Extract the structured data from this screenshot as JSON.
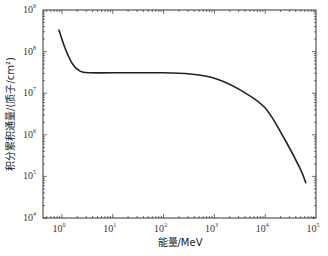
{
  "chart_data": {
    "type": "line",
    "title": "",
    "xlabel": "能量/MeV",
    "ylabel": "积分累积通量/(质子/cm²)",
    "xscale": "log",
    "yscale": "log",
    "xlim": [
      0.5,
      100000
    ],
    "ylim": [
      10000,
      1000000000
    ],
    "x_ticks": [
      1,
      10,
      100,
      1000,
      10000,
      100000
    ],
    "x_tick_labels": [
      "10^0",
      "10^1",
      "10^2",
      "10^3",
      "10^4",
      "10^5"
    ],
    "y_ticks": [
      10000,
      100000,
      1000000,
      10000000,
      100000000,
      1000000000
    ],
    "y_tick_labels": [
      "10^4",
      "10^5",
      "10^6",
      "10^7",
      "10^8",
      "10^9"
    ],
    "grid": false,
    "legend": null,
    "series": [
      {
        "name": "integral fluence",
        "color": "#222222",
        "x": [
          0.87,
          1.15,
          1.57,
          2.26,
          3.6,
          10,
          100,
          330,
          1000,
          3200,
          10000,
          24600,
          48000,
          63000
        ],
        "y": [
          330000000,
          120000000,
          53000000,
          34000000,
          31000000,
          31000000,
          31000000,
          29000000,
          23000000,
          12000000,
          4400000,
          750000,
          160000,
          71000
        ]
      }
    ]
  },
  "axes": {
    "x_title": "能量/MeV",
    "y_title": "积分累积通量/(质子/cm²)",
    "x_tick_bases": [
      "10",
      "10",
      "10",
      "10",
      "10",
      "10"
    ],
    "x_tick_exps": [
      "0",
      "1",
      "2",
      "3",
      "4",
      "5"
    ],
    "y_tick_bases": [
      "10",
      "10",
      "10",
      "10",
      "10",
      "10"
    ],
    "y_tick_exps": [
      "4",
      "5",
      "6",
      "7",
      "8",
      "9"
    ]
  }
}
